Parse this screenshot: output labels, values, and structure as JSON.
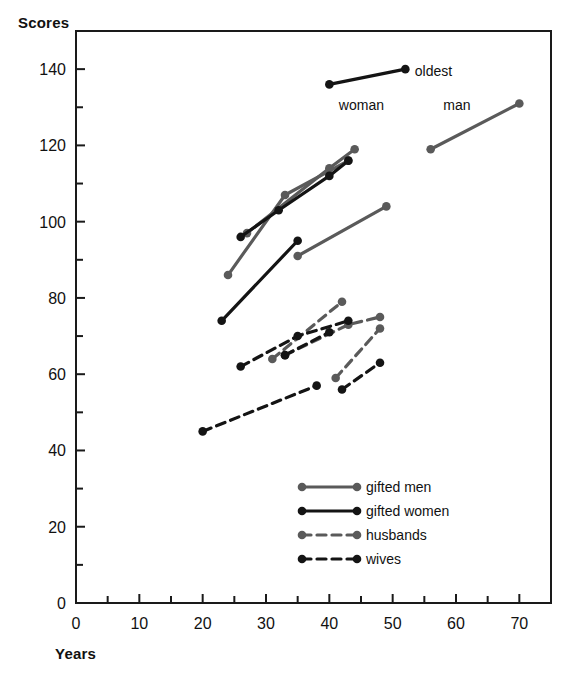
{
  "figure": {
    "background": "#ffffff",
    "frame_color": "#1a1a1a"
  },
  "axis": {
    "y_title": "Scores",
    "x_title": "Years"
  },
  "annotations": [
    {
      "text": "oldest",
      "x": 53.5,
      "y": 139.5
    },
    {
      "text": "woman",
      "x": 41.5,
      "y": 130.5
    },
    {
      "text": "man",
      "x": 58.0,
      "y": 130.5
    }
  ],
  "legend": {
    "entries": [
      {
        "label": "gifted men",
        "color": "#5a5a5a",
        "dash": false
      },
      {
        "label": "gifted women",
        "color": "#141414",
        "dash": false
      },
      {
        "label": "husbands",
        "color": "#5a5a5a",
        "dash": true
      },
      {
        "label": "wives",
        "color": "#141414",
        "dash": true
      }
    ]
  },
  "chart_data": {
    "type": "line",
    "title": "",
    "xlabel": "Years",
    "ylabel": "Scores",
    "xlim": [
      0,
      75
    ],
    "ylim": [
      0,
      150
    ],
    "xticks": [
      0,
      10,
      20,
      30,
      40,
      50,
      60,
      70
    ],
    "xticks_minor": [
      5,
      15,
      25,
      35,
      45,
      55,
      65
    ],
    "yticks": [
      0,
      20,
      40,
      60,
      80,
      100,
      120,
      140
    ],
    "yticks_minor": [
      10,
      30,
      50,
      70,
      90,
      110,
      130
    ],
    "grid": false,
    "legend_position": "lower right",
    "series": [
      {
        "name": "gifted men",
        "color": "#5a5a5a",
        "dash": false,
        "segments": [
          {
            "label": "oldest man",
            "points": [
              [
                56,
                119
              ],
              [
                70,
                131
              ]
            ]
          },
          {
            "label": "gifted men A",
            "points": [
              [
                27,
                97
              ],
              [
                40,
                114
              ],
              [
                44,
                119
              ]
            ]
          },
          {
            "label": "gifted men B",
            "points": [
              [
                24,
                86
              ],
              [
                33,
                107
              ],
              [
                43,
                116
              ]
            ]
          },
          {
            "label": "gifted men C",
            "points": [
              [
                35,
                91
              ],
              [
                49,
                104
              ]
            ]
          }
        ]
      },
      {
        "name": "gifted women",
        "color": "#141414",
        "dash": false,
        "segments": [
          {
            "label": "oldest woman",
            "points": [
              [
                40,
                136
              ],
              [
                52,
                140
              ]
            ]
          },
          {
            "label": "gifted women A",
            "points": [
              [
                26,
                96
              ],
              [
                32,
                103
              ],
              [
                40,
                112
              ],
              [
                43,
                116
              ]
            ]
          },
          {
            "label": "gifted women B",
            "points": [
              [
                23,
                74
              ],
              [
                35,
                95
              ]
            ]
          }
        ]
      },
      {
        "name": "husbands",
        "color": "#5a5a5a",
        "dash": true,
        "segments": [
          {
            "label": "husbands A",
            "points": [
              [
                31,
                64
              ],
              [
                42,
                79
              ]
            ]
          },
          {
            "label": "husbands B",
            "points": [
              [
                33,
                65
              ],
              [
                43,
                73
              ],
              [
                48,
                75
              ]
            ]
          },
          {
            "label": "husbands C",
            "points": [
              [
                41,
                59
              ],
              [
                48,
                72
              ]
            ]
          }
        ]
      },
      {
        "name": "wives",
        "color": "#141414",
        "dash": true,
        "segments": [
          {
            "label": "wives A",
            "points": [
              [
                26,
                62
              ],
              [
                35,
                70
              ],
              [
                43,
                74
              ]
            ]
          },
          {
            "label": "wives B",
            "points": [
              [
                33,
                65
              ],
              [
                40,
                71
              ]
            ]
          },
          {
            "label": "wives C",
            "points": [
              [
                20,
                45
              ],
              [
                38,
                57
              ]
            ]
          },
          {
            "label": "wives D",
            "points": [
              [
                42,
                56
              ],
              [
                48,
                63
              ]
            ]
          }
        ]
      }
    ]
  }
}
